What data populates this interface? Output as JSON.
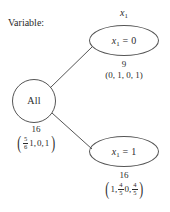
{
  "diagram": {
    "type": "decision-tree",
    "variable_prompt": "Variable:",
    "split_variable": "x₁",
    "root": {
      "label": "All",
      "count": "16",
      "vector_text": "(5/6, 1, 0, 1)",
      "vector_items": [
        "5/6",
        "1",
        "0",
        "1"
      ],
      "paren_open": "(",
      "paren_close": ")",
      "frac_num": "5",
      "frac_den": "6",
      "item2": "1,",
      "item3": "0,",
      "item4": "1"
    },
    "children": [
      {
        "id": "x1-0",
        "label": "x₁ = 0",
        "label_var": "x",
        "label_sub": "1",
        "label_eq": "= 0",
        "count": "9",
        "vector_text": "(0, 1, 0, 1)"
      },
      {
        "id": "x1-1",
        "label": "x₁ = 1",
        "label_var": "x",
        "label_sub": "1",
        "label_eq": "= 1",
        "count": "16",
        "vector_text": "(1, 4/5, 0, 4/5)",
        "paren_open": "(",
        "paren_close": ")",
        "item1": "1,",
        "frac1_num": "4",
        "frac1_den": "5",
        "item3": "0,",
        "frac2_num": "4",
        "frac2_den": "5"
      }
    ],
    "colors": {
      "stroke": "#555555",
      "text": "#2b2b2b",
      "background": "#ffffff"
    }
  }
}
